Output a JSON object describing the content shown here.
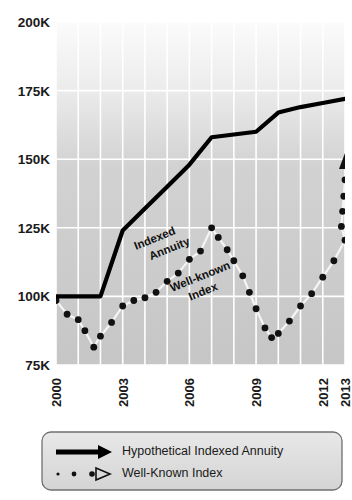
{
  "chart_data": {
    "type": "line",
    "title": "",
    "xlabel": "",
    "ylabel": "",
    "ylim": [
      75000,
      200000
    ],
    "xlim": [
      2000,
      2013
    ],
    "grid": true,
    "y_ticks": [
      75000,
      100000,
      125000,
      150000,
      175000,
      200000
    ],
    "y_ticklabels": [
      "75K",
      "100K",
      "125K",
      "150K",
      "175K",
      "200K"
    ],
    "x_ticks": [
      2000,
      2003,
      2006,
      2009,
      2012,
      2013
    ],
    "x_ticklabels": [
      "2000",
      "2003",
      "2006",
      "2009",
      "2012",
      "2013"
    ],
    "x_gridline_years": [
      2000,
      2001,
      2002,
      2003,
      2004,
      2005,
      2006,
      2007,
      2008,
      2009,
      2010,
      2011,
      2012,
      2013
    ],
    "legend_position": "bottom",
    "series": [
      {
        "name": "Hypothetical Indexed Annuity",
        "style": "solid-thick",
        "color": "#000000",
        "inline_label": "Indexed\nAnnuity",
        "x": [
          2000,
          2001,
          2002,
          2003,
          2004,
          2005,
          2006,
          2007,
          2008,
          2009,
          2010,
          2011,
          2012,
          2013
        ],
        "values": [
          100000,
          100000,
          100000,
          124000,
          132000,
          140000,
          148000,
          158000,
          159000,
          160000,
          167000,
          169000,
          170500,
          172000
        ]
      },
      {
        "name": "Well-Known Index",
        "style": "dotted-markers",
        "color": "#ffffff",
        "marker_color": "#111111",
        "inline_label": "Well-known\nIndex",
        "x": [
          2000.0,
          2000.5,
          2001.0,
          2001.3,
          2001.7,
          2002.0,
          2002.5,
          2003.0,
          2003.5,
          2004.0,
          2004.5,
          2005.0,
          2005.5,
          2006.0,
          2006.5,
          2007.0,
          2007.3,
          2007.7,
          2008.0,
          2008.4,
          2008.7,
          2009.0,
          2009.4,
          2009.7,
          2010.0,
          2010.5,
          2011.0,
          2011.5,
          2012.0,
          2012.5,
          2013.0
        ],
        "values": [
          98500,
          93500,
          91500,
          87500,
          81500,
          85500,
          90500,
          96500,
          98500,
          99500,
          101500,
          105500,
          108500,
          113500,
          116500,
          125000,
          121500,
          117000,
          113000,
          107500,
          101500,
          95500,
          88500,
          85000,
          86500,
          91000,
          96500,
          101000,
          107000,
          113000,
          120500
        ]
      }
    ],
    "index_end_marker_values": [
      125500,
      131000,
      136500,
      142500
    ],
    "arrow_marker": {
      "x": 2013,
      "y": 149000,
      "shape": "triangle-up"
    }
  },
  "legend": {
    "items": [
      {
        "label": "Hypothetical Indexed Annuity",
        "marker": "solid-arrow-line"
      },
      {
        "label": "Well-Known Index",
        "marker": "dotted-arrow-line"
      }
    ]
  },
  "colors": {
    "plot_background": "#c9c9c9",
    "gridline": "#ffffff",
    "annuity_line": "#000000",
    "index_marker": "#111111",
    "index_line": "#f4f4f4",
    "legend_background": "#dedede",
    "legend_border": "#6f6f6f",
    "text": "#1a1a1a"
  }
}
